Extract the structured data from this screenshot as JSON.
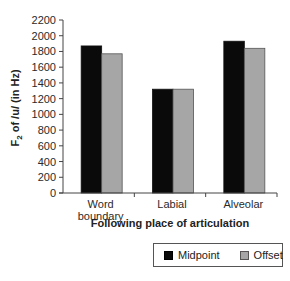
{
  "chart_data": {
    "type": "bar",
    "title": "",
    "xlabel": "Following place of articulation",
    "ylabel": "F2 of /u/ (in Hz)",
    "ylabel_main": "F",
    "ylabel_sub": "2",
    "ylabel_rest": " of /u/ (in Hz)",
    "categories": [
      "Word boundary",
      "Labial",
      "Alveolar"
    ],
    "category_lines": [
      [
        "Word",
        "boundary"
      ],
      [
        "Labial"
      ],
      [
        "Alveolar"
      ]
    ],
    "series": [
      {
        "name": "Midpoint",
        "color": "#0a0a0a",
        "values": [
          1870,
          1320,
          1930
        ]
      },
      {
        "name": "Offset",
        "color": "#a6a6a6",
        "values": [
          1770,
          1320,
          1840
        ]
      }
    ],
    "ylim": [
      0,
      2200
    ],
    "yticks": [
      0,
      200,
      400,
      600,
      800,
      1000,
      1200,
      1400,
      1600,
      1800,
      2000,
      2200
    ],
    "grid": false,
    "legend_position": "bottom"
  },
  "legend": {
    "items": [
      {
        "label": "Midpoint",
        "color": "#0a0a0a"
      },
      {
        "label": "Offset",
        "color": "#a6a6a6"
      }
    ]
  }
}
